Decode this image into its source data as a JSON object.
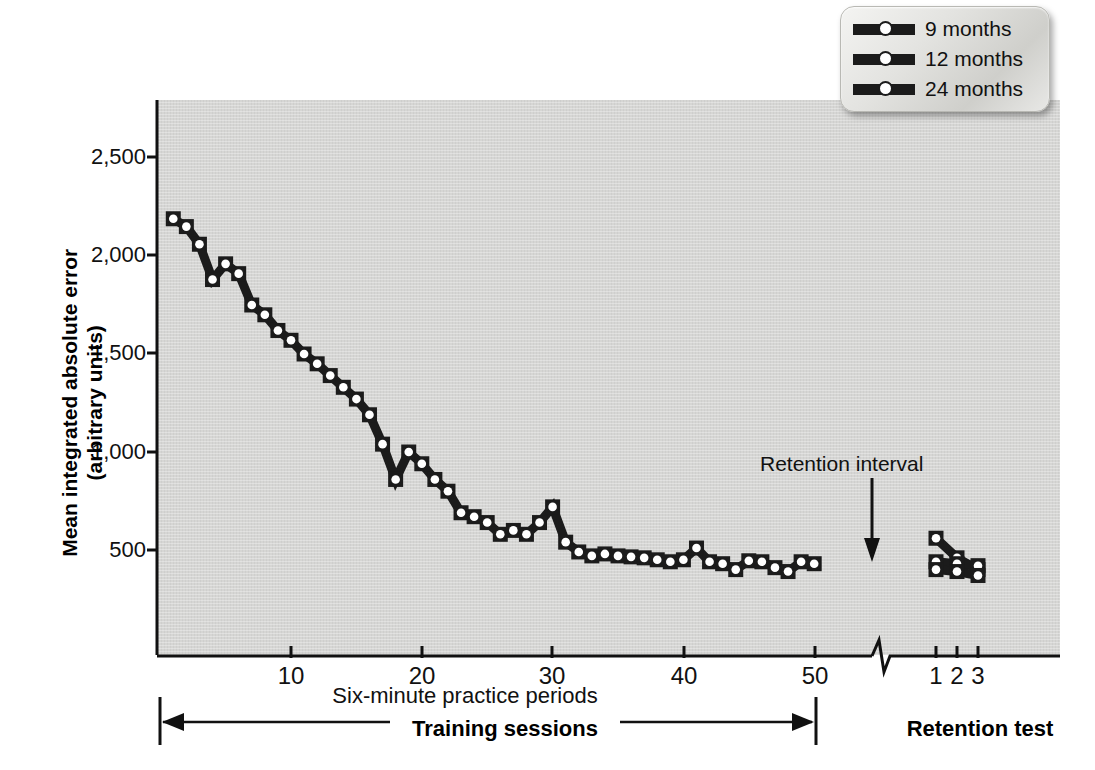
{
  "chart_data": {
    "type": "line",
    "title": "",
    "xlabel": "Six-minute practice periods",
    "ylabel": "Mean integrated absolute error (arbitrary units)",
    "ylabel_line1": "Mean integrated absolute error",
    "ylabel_line2": "(arbitrary units)",
    "ylim": [
      0,
      2700
    ],
    "yticks": [
      500,
      1000,
      1500,
      2000,
      2500
    ],
    "ytick_labels": [
      "500",
      "1,000",
      "1,500",
      "2,000",
      "2,500"
    ],
    "xlim": [
      0,
      55
    ],
    "xticks": [
      10,
      20,
      30,
      40,
      50
    ],
    "xtick_labels": [
      "10",
      "20",
      "30",
      "40",
      "50"
    ],
    "retention_xticks": [
      1,
      2,
      3
    ],
    "retention_xtick_labels": [
      "1",
      "2",
      "3"
    ],
    "grid": false,
    "legend_position": "top-right",
    "axis_break": true,
    "annotations": [
      {
        "name": "retention-interval",
        "text": "Retention interval"
      },
      {
        "name": "training-sessions-bracket",
        "text": "Training sessions"
      },
      {
        "name": "retention-test-bracket",
        "text": "Retention test"
      }
    ],
    "legend": [
      {
        "label": "9 months",
        "color": "#1b1b1b"
      },
      {
        "label": "12 months",
        "color": "#1b1b1b"
      },
      {
        "label": "24 months",
        "color": "#1b1b1b"
      }
    ],
    "training_series": {
      "name": "Training (pooled)",
      "x": [
        1,
        2,
        3,
        4,
        5,
        6,
        7,
        8,
        9,
        10,
        11,
        12,
        13,
        14,
        15,
        16,
        17,
        18,
        19,
        20,
        21,
        22,
        23,
        24,
        25,
        26,
        27,
        28,
        29,
        30,
        31,
        32,
        33,
        34,
        35,
        36,
        37,
        38,
        39,
        40,
        41,
        42,
        43,
        44,
        45,
        46,
        47,
        48,
        49,
        50
      ],
      "values": [
        2190,
        2150,
        2060,
        1880,
        1960,
        1910,
        1750,
        1700,
        1620,
        1570,
        1500,
        1450,
        1390,
        1330,
        1270,
        1190,
        1040,
        860,
        1000,
        940,
        860,
        800,
        690,
        670,
        640,
        580,
        600,
        580,
        640,
        720,
        540,
        490,
        470,
        480,
        470,
        465,
        460,
        450,
        440,
        450,
        510,
        440,
        430,
        400,
        445,
        440,
        410,
        390,
        440,
        430,
        425,
        415,
        400,
        375,
        410,
        420,
        400,
        370,
        390,
        300,
        340
      ]
    },
    "training_series_note": "Single pooled descending learning curve across 50 six-minute practice periods",
    "retention_series": [
      {
        "name": "9 months",
        "x": [
          1,
          2,
          3
        ],
        "values": [
          560,
          460,
          400
        ]
      },
      {
        "name": "12 months",
        "x": [
          1,
          2,
          3
        ],
        "values": [
          440,
          430,
          420
        ]
      },
      {
        "name": "24 months",
        "x": [
          1,
          2,
          3
        ],
        "values": [
          400,
          390,
          370
        ]
      }
    ]
  },
  "axis": {
    "y_title_line1": "Mean integrated absolute error",
    "y_title_line2": "(arbitrary units)",
    "x_title": "Six-minute practice periods"
  },
  "legend": {
    "items": [
      {
        "label": "9 months"
      },
      {
        "label": "12 months"
      },
      {
        "label": "24 months"
      }
    ]
  },
  "annotations": {
    "retention_interval": "Retention interval",
    "training_sessions": "Training sessions",
    "retention_test": "Retention test"
  },
  "colors": {
    "plot_background": "#d6d6d4",
    "line": "#1b1b1b",
    "marker_fill": "#ffffff",
    "text": "#111111",
    "page_background": "#ffffff"
  }
}
